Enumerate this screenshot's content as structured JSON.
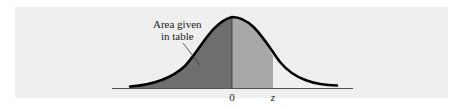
{
  "figure": {
    "type": "standard-normal-curve",
    "annotation": {
      "line1": "Area given",
      "line2": "in table"
    },
    "axis_labels": {
      "mean": "0",
      "z": "z"
    },
    "colors": {
      "panel_background": "#efefef",
      "left_shaded_area": "#6e6e6e",
      "right_shaded_area": "#a8a8a8",
      "curve": "#000000",
      "axis": "#555555"
    }
  }
}
